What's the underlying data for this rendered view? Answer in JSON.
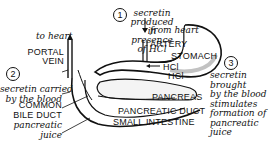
{
  "diagram": {
    "title": "",
    "steps": [
      {
        "number": "1",
        "text_lines": [
          "secretin",
          "produced",
          "in",
          "presence",
          "of HCl"
        ]
      },
      {
        "number": "2",
        "text_lines": [
          "secretin carried",
          "by the blood"
        ]
      },
      {
        "number": "3",
        "text_lines": [
          "secretin",
          "brought",
          "by the blood",
          "stimulates",
          "formation of",
          "pancreatic",
          "juice"
        ]
      }
    ],
    "labels": {
      "to_heart": "to heart",
      "from_heart": "from heart",
      "artery": "ARTERY",
      "portal_vein_1": "PORTAL",
      "portal_vein_2": "VEIN",
      "stomach": "STOMACH",
      "hcl_1": "HCl",
      "hcl_2": "HCl",
      "common_bile_duct_1": "COMMON",
      "common_bile_duct_2": "BILE DUCT",
      "pancreas": "PANCREAS",
      "pancreatic_duct": "PANCREATIC DUCT",
      "small_intestine": "SMALL INTESTINE",
      "pancreatic_juice_1": "pancreatic",
      "pancreatic_juice_2": "juice"
    },
    "colors": {
      "ink": "#111111",
      "background": "#ffffff",
      "shade": "#9a9a9a"
    }
  }
}
